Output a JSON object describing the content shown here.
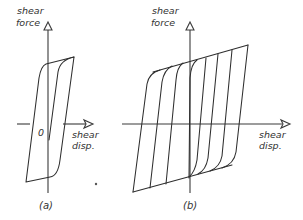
{
  "figure_a": {
    "caption": "(a)",
    "y_label_line1": "shear",
    "y_label_line2": "force",
    "x_label_line1": "shear",
    "x_label_line2": "disp.",
    "origin_label": "0"
  },
  "figure_b": {
    "caption": "(b)",
    "y_label_line1": "shear",
    "y_label_line2": "force",
    "x_label_line1": "shear",
    "x_label_line2": "disp."
  },
  "colors": {
    "line": "#2e2e2e",
    "background": "#ffffff"
  }
}
